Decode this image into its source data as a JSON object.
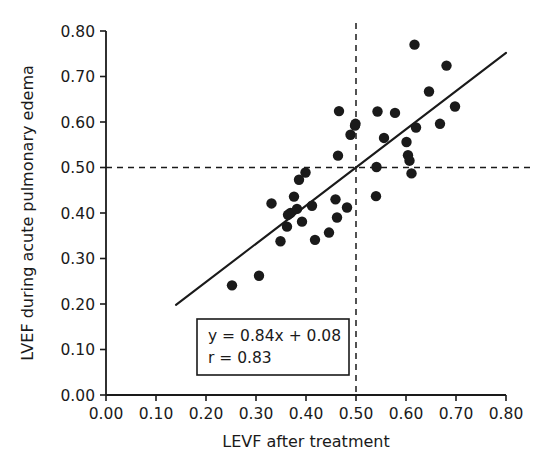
{
  "chart_data": {
    "type": "scatter",
    "title": "",
    "xlabel": "LEVF after treatment",
    "ylabel": "LVEF during acute pulmonary edema",
    "xlim": [
      0.0,
      0.8
    ],
    "ylim": [
      0.0,
      0.8
    ],
    "grid": false,
    "legend": null,
    "xticks": [
      "0.00",
      "0.10",
      "0.20",
      "0.30",
      "0.40",
      "0.50",
      "0.60",
      "0.70",
      "0.80"
    ],
    "yticks": [
      "0.00",
      "0.10",
      "0.20",
      "0.30",
      "0.40",
      "0.50",
      "0.60",
      "0.70",
      "0.80"
    ],
    "xtick_values": [
      0.0,
      0.1,
      0.2,
      0.3,
      0.4,
      0.5,
      0.6,
      0.7,
      0.8
    ],
    "ytick_values": [
      0.0,
      0.1,
      0.2,
      0.3,
      0.4,
      0.5,
      0.6,
      0.7,
      0.8
    ],
    "marker": "filled-circle",
    "marker_color": "#1a1a1a",
    "marker_size": 5.2,
    "points": [
      {
        "x": 0.252,
        "y": 0.241
      },
      {
        "x": 0.306,
        "y": 0.262
      },
      {
        "x": 0.331,
        "y": 0.421
      },
      {
        "x": 0.349,
        "y": 0.338
      },
      {
        "x": 0.362,
        "y": 0.37
      },
      {
        "x": 0.364,
        "y": 0.396
      },
      {
        "x": 0.369,
        "y": 0.4
      },
      {
        "x": 0.376,
        "y": 0.436
      },
      {
        "x": 0.382,
        "y": 0.409
      },
      {
        "x": 0.386,
        "y": 0.473
      },
      {
        "x": 0.392,
        "y": 0.381
      },
      {
        "x": 0.399,
        "y": 0.489
      },
      {
        "x": 0.412,
        "y": 0.416
      },
      {
        "x": 0.418,
        "y": 0.341
      },
      {
        "x": 0.446,
        "y": 0.357
      },
      {
        "x": 0.459,
        "y": 0.43
      },
      {
        "x": 0.462,
        "y": 0.39
      },
      {
        "x": 0.464,
        "y": 0.526
      },
      {
        "x": 0.466,
        "y": 0.624
      },
      {
        "x": 0.482,
        "y": 0.412
      },
      {
        "x": 0.489,
        "y": 0.572
      },
      {
        "x": 0.498,
        "y": 0.592
      },
      {
        "x": 0.499,
        "y": 0.596
      },
      {
        "x": 0.54,
        "y": 0.437
      },
      {
        "x": 0.541,
        "y": 0.501
      },
      {
        "x": 0.543,
        "y": 0.623
      },
      {
        "x": 0.556,
        "y": 0.565
      },
      {
        "x": 0.578,
        "y": 0.62
      },
      {
        "x": 0.601,
        "y": 0.556
      },
      {
        "x": 0.604,
        "y": 0.527
      },
      {
        "x": 0.607,
        "y": 0.515
      },
      {
        "x": 0.611,
        "y": 0.487
      },
      {
        "x": 0.617,
        "y": 0.77
      },
      {
        "x": 0.62,
        "y": 0.588
      },
      {
        "x": 0.646,
        "y": 0.667
      },
      {
        "x": 0.668,
        "y": 0.596
      },
      {
        "x": 0.681,
        "y": 0.724
      },
      {
        "x": 0.698,
        "y": 0.634
      }
    ],
    "fit_line": {
      "slope": 0.84,
      "intercept": 0.08,
      "x_start": 0.14,
      "x_end": 0.8,
      "y_start": 0.198,
      "y_end": 0.752,
      "color": "#1a1a1a",
      "width": 2.1
    },
    "reference_lines": [
      {
        "orientation": "horizontal",
        "value": 0.5,
        "style": "dashed",
        "color": "#1a1a1a"
      },
      {
        "orientation": "vertical",
        "value": 0.5,
        "style": "dashed",
        "color": "#1a1a1a"
      }
    ],
    "annotation_box": {
      "equation": "y = 0.84x + 0.08",
      "correlation": "r = 0.83",
      "border_color": "#1a1a1a"
    }
  },
  "axes": {
    "x_title": "LEVF after treatment",
    "y_title": "LVEF during acute pulmonary edema"
  }
}
